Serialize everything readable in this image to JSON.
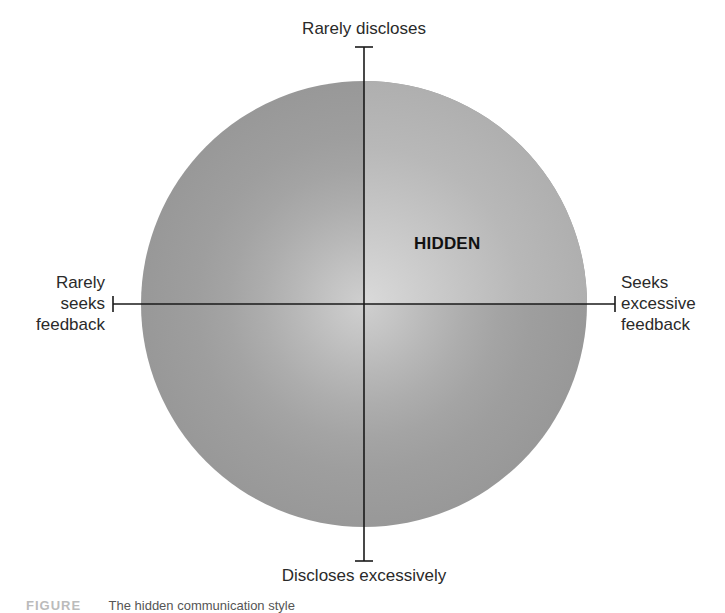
{
  "diagram": {
    "axes": {
      "vertical": {
        "top_label": "Rarely discloses",
        "bottom_label": "Discloses excessively"
      },
      "horizontal": {
        "left_label_lines": [
          "Rarely",
          "seeks",
          "feedback"
        ],
        "right_label_lines": [
          "Seeks",
          "excessive",
          "feedback"
        ]
      }
    },
    "highlighted_quadrant": {
      "position": "top-right",
      "label": "HIDDEN"
    },
    "colors": {
      "circle_outer": "#9a9a9a",
      "circle_inner": "#c9c9c9",
      "highlight_outer": "#b0b0b0",
      "highlight_inner": "#d4d4d4",
      "axis_line": "#1a1a1a",
      "background": "#ffffff"
    },
    "caption": {
      "prefix": "FIGURE",
      "text": "The hidden communication style"
    }
  }
}
